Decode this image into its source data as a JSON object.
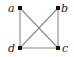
{
  "graph": {
    "vertices": [
      {
        "id": "a",
        "label": "a",
        "x": 20,
        "y": 8,
        "lx": 8,
        "ly": 12
      },
      {
        "id": "b",
        "label": "b",
        "x": 58,
        "y": 8,
        "lx": 61,
        "ly": 12
      },
      {
        "id": "c",
        "label": "c",
        "x": 58,
        "y": 48,
        "lx": 62,
        "ly": 52
      },
      {
        "id": "d",
        "label": "d",
        "x": 20,
        "y": 48,
        "lx": 8,
        "ly": 52
      }
    ],
    "edges": [
      [
        "a",
        "d"
      ],
      [
        "a",
        "c"
      ],
      [
        "b",
        "d"
      ],
      [
        "b",
        "c"
      ],
      [
        "d",
        "c"
      ]
    ],
    "colors": {
      "edge": "#8a8a8a",
      "vertex": "#111111",
      "label": "#222222"
    }
  }
}
